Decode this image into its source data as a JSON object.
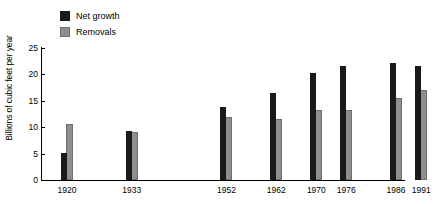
{
  "chart_data": {
    "type": "bar",
    "title": "",
    "xlabel": "",
    "ylabel": "Billions of cubic feet per year",
    "categories": [
      "1920",
      "1933",
      "1952",
      "1962",
      "1970",
      "1976",
      "1986",
      "1991"
    ],
    "category_positions": [
      0.055,
      0.233,
      0.493,
      0.63,
      0.74,
      0.822,
      0.959,
      1.028
    ],
    "series": [
      {
        "name": "Net growth",
        "color": "#1a1a1a",
        "values": [
          5.1,
          9.2,
          13.8,
          16.5,
          20.2,
          21.5,
          22.2,
          21.5
        ]
      },
      {
        "name": "Removals",
        "color": "#8f8f8f",
        "values": [
          10.7,
          9.0,
          12.0,
          11.5,
          13.2,
          13.2,
          15.5,
          17.0
        ]
      }
    ],
    "ylim": [
      0,
      25
    ],
    "yticks": [
      0,
      5,
      10,
      15,
      20,
      25
    ],
    "ytick_labels": [
      "0",
      "5",
      "10",
      "15",
      "20",
      "25"
    ],
    "grid": false,
    "legend_position": "top-left"
  },
  "legend": {
    "items": [
      {
        "label": "Net growth",
        "swatch": "net-growth-swatch"
      },
      {
        "label": "Removals",
        "swatch": "removals-swatch"
      }
    ]
  },
  "axes": {
    "y_title": "Billions of cubic feet per year"
  }
}
